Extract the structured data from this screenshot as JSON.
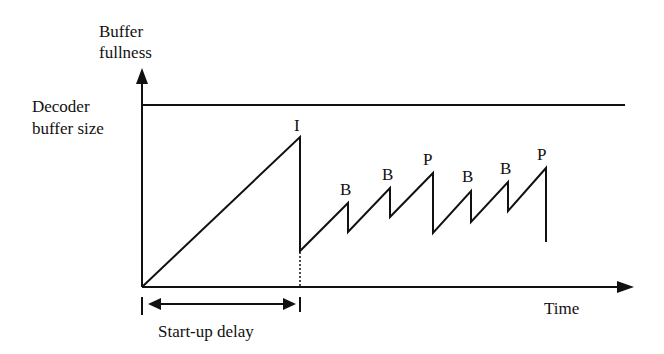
{
  "diagram": {
    "y_axis_label_line1": "Buffer",
    "y_axis_label_line2": "fullness",
    "x_axis_label": "Time",
    "buffer_size_label_line1": "Decoder",
    "buffer_size_label_line2": "buffer size",
    "startup_label": "Start-up delay",
    "frames": [
      {
        "type": "I",
        "peak": [
          300,
          137
        ],
        "trough": [
          300,
          251
        ]
      },
      {
        "type": "B",
        "peak": [
          348,
          203
        ],
        "trough": [
          348,
          232
        ]
      },
      {
        "type": "B",
        "peak": [
          390,
          188
        ],
        "trough": [
          390,
          217
        ]
      },
      {
        "type": "P",
        "peak": [
          433,
          173
        ],
        "trough": [
          433,
          233
        ]
      },
      {
        "type": "B",
        "peak": [
          471,
          191
        ],
        "trough": [
          471,
          222
        ]
      },
      {
        "type": "B",
        "peak": [
          508,
          182
        ],
        "trough": [
          508,
          211
        ]
      },
      {
        "type": "P",
        "peak": [
          546,
          168
        ],
        "trough": [
          546,
          242
        ]
      }
    ],
    "colors": {
      "line": "#111111",
      "background": "#ffffff"
    }
  }
}
